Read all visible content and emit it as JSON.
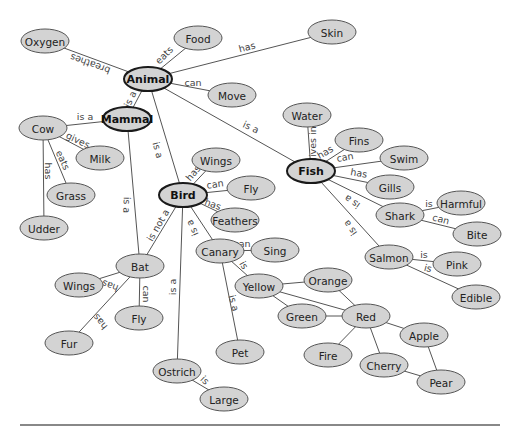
{
  "diagram": {
    "type": "semantic-network",
    "colors": {
      "node_fill": "#d3d3d3",
      "node_border": "#555555",
      "main_border": "#1a1a1a",
      "edge": "#555555",
      "rule": "#888888"
    },
    "nodes": [
      {
        "id": "oxygen",
        "label": "Oxygen",
        "x": 45,
        "y": 41,
        "rx": 24,
        "ry": 12,
        "main": false
      },
      {
        "id": "food",
        "label": "Food",
        "x": 198,
        "y": 38,
        "rx": 24,
        "ry": 12,
        "main": false
      },
      {
        "id": "skin",
        "label": "Skin",
        "x": 332,
        "y": 32,
        "rx": 24,
        "ry": 12,
        "main": false
      },
      {
        "id": "animal",
        "label": "Animal",
        "x": 148,
        "y": 79,
        "rx": 24,
        "ry": 12,
        "main": true
      },
      {
        "id": "move",
        "label": "Move",
        "x": 232,
        "y": 95,
        "rx": 24,
        "ry": 12,
        "main": false
      },
      {
        "id": "mammal",
        "label": "Mammal",
        "x": 127,
        "y": 119,
        "rx": 24,
        "ry": 12,
        "main": true
      },
      {
        "id": "cow",
        "label": "Cow",
        "x": 43,
        "y": 128,
        "rx": 24,
        "ry": 12,
        "main": false
      },
      {
        "id": "milk",
        "label": "Milk",
        "x": 100,
        "y": 158,
        "rx": 24,
        "ry": 12,
        "main": false
      },
      {
        "id": "grass",
        "label": "Grass",
        "x": 71,
        "y": 195,
        "rx": 24,
        "ry": 12,
        "main": false
      },
      {
        "id": "udder",
        "label": "Udder",
        "x": 44,
        "y": 228,
        "rx": 24,
        "ry": 12,
        "main": false
      },
      {
        "id": "water",
        "label": "Water",
        "x": 307,
        "y": 115,
        "rx": 24,
        "ry": 12,
        "main": false
      },
      {
        "id": "fins",
        "label": "Fins",
        "x": 359,
        "y": 140,
        "rx": 24,
        "ry": 12,
        "main": false
      },
      {
        "id": "swim",
        "label": "Swim",
        "x": 404,
        "y": 158,
        "rx": 24,
        "ry": 12,
        "main": false
      },
      {
        "id": "fish",
        "label": "Fish",
        "x": 311,
        "y": 171,
        "rx": 24,
        "ry": 12,
        "main": true
      },
      {
        "id": "gills",
        "label": "Gills",
        "x": 390,
        "y": 187,
        "rx": 24,
        "ry": 12,
        "main": false
      },
      {
        "id": "harmful",
        "label": "Harmful",
        "x": 461,
        "y": 203,
        "rx": 24,
        "ry": 12,
        "main": false
      },
      {
        "id": "shark",
        "label": "Shark",
        "x": 400,
        "y": 215,
        "rx": 24,
        "ry": 12,
        "main": false
      },
      {
        "id": "bite",
        "label": "Bite",
        "x": 477,
        "y": 234,
        "rx": 24,
        "ry": 12,
        "main": false
      },
      {
        "id": "salmon",
        "label": "Salmon",
        "x": 389,
        "y": 257,
        "rx": 24,
        "ry": 12,
        "main": false
      },
      {
        "id": "pink",
        "label": "Pink",
        "x": 457,
        "y": 264,
        "rx": 24,
        "ry": 12,
        "main": false
      },
      {
        "id": "edible",
        "label": "Edible",
        "x": 476,
        "y": 297,
        "rx": 24,
        "ry": 12,
        "main": false
      },
      {
        "id": "wings_bird",
        "label": "Wings",
        "x": 216,
        "y": 160,
        "rx": 24,
        "ry": 12,
        "main": false
      },
      {
        "id": "fly_bird",
        "label": "Fly",
        "x": 251,
        "y": 188,
        "rx": 24,
        "ry": 12,
        "main": false
      },
      {
        "id": "bird",
        "label": "Bird",
        "x": 183,
        "y": 195,
        "rx": 24,
        "ry": 12,
        "main": true
      },
      {
        "id": "feathers",
        "label": "Feathers",
        "x": 235,
        "y": 220,
        "rx": 24,
        "ry": 12,
        "main": false
      },
      {
        "id": "canary",
        "label": "Canary",
        "x": 220,
        "y": 251,
        "rx": 24,
        "ry": 12,
        "main": false
      },
      {
        "id": "sing",
        "label": "Sing",
        "x": 275,
        "y": 250,
        "rx": 24,
        "ry": 12,
        "main": false
      },
      {
        "id": "orange",
        "label": "Orange",
        "x": 328,
        "y": 280,
        "rx": 24,
        "ry": 12,
        "main": false
      },
      {
        "id": "yellow",
        "label": "Yellow",
        "x": 259,
        "y": 286,
        "rx": 24,
        "ry": 12,
        "main": false
      },
      {
        "id": "green",
        "label": "Green",
        "x": 302,
        "y": 316,
        "rx": 24,
        "ry": 12,
        "main": false
      },
      {
        "id": "red",
        "label": "Red",
        "x": 366,
        "y": 316,
        "rx": 24,
        "ry": 12,
        "main": false
      },
      {
        "id": "apple",
        "label": "Apple",
        "x": 424,
        "y": 335,
        "rx": 24,
        "ry": 12,
        "main": false
      },
      {
        "id": "fire",
        "label": "Fire",
        "x": 328,
        "y": 355,
        "rx": 24,
        "ry": 12,
        "main": false
      },
      {
        "id": "cherry",
        "label": "Cherry",
        "x": 384,
        "y": 365,
        "rx": 24,
        "ry": 12,
        "main": false
      },
      {
        "id": "pear",
        "label": "Pear",
        "x": 441,
        "y": 382,
        "rx": 24,
        "ry": 12,
        "main": false
      },
      {
        "id": "bat",
        "label": "Bat",
        "x": 140,
        "y": 266,
        "rx": 24,
        "ry": 12,
        "main": false
      },
      {
        "id": "wings_bat",
        "label": "Wings",
        "x": 79,
        "y": 285,
        "rx": 24,
        "ry": 12,
        "main": false
      },
      {
        "id": "fly_bat",
        "label": "Fly",
        "x": 139,
        "y": 318,
        "rx": 24,
        "ry": 12,
        "main": false
      },
      {
        "id": "fur",
        "label": "Fur",
        "x": 69,
        "y": 343,
        "rx": 24,
        "ry": 12,
        "main": false
      },
      {
        "id": "pet",
        "label": "Pet",
        "x": 240,
        "y": 352,
        "rx": 24,
        "ry": 12,
        "main": false
      },
      {
        "id": "ostrich",
        "label": "Ostrich",
        "x": 177,
        "y": 371,
        "rx": 24,
        "ry": 12,
        "main": false
      },
      {
        "id": "large",
        "label": "Large",
        "x": 224,
        "y": 399,
        "rx": 24,
        "ry": 12,
        "main": false
      }
    ],
    "edges": [
      {
        "from": "animal",
        "to": "oxygen",
        "label": "breathes",
        "lx": 90,
        "ly": 64,
        "rot": 200
      },
      {
        "from": "animal",
        "to": "food",
        "label": "eats",
        "lx": 164,
        "ly": 55,
        "rot": -45
      },
      {
        "from": "animal",
        "to": "skin",
        "label": "has",
        "lx": 247,
        "ly": 47,
        "rot": -15
      },
      {
        "from": "animal",
        "to": "move",
        "label": "can",
        "lx": 193,
        "ly": 82,
        "rot": 0
      },
      {
        "from": "animal",
        "to": "mammal",
        "label": "is a",
        "lx": 130,
        "ly": 99,
        "rot": -65
      },
      {
        "from": "animal",
        "to": "bird",
        "label": "is a",
        "lx": 158,
        "ly": 150,
        "rot": 75
      },
      {
        "from": "animal",
        "to": "fish",
        "label": "is a",
        "lx": 251,
        "ly": 127,
        "rot": 25
      },
      {
        "from": "mammal",
        "to": "cow",
        "label": "is a",
        "lx": 85,
        "ly": 116,
        "rot": 0
      },
      {
        "from": "mammal",
        "to": "bat",
        "label": "is a",
        "lx": 127,
        "ly": 205,
        "rot": 92
      },
      {
        "from": "cow",
        "to": "milk",
        "label": "gives",
        "lx": 78,
        "ly": 140,
        "rot": 25
      },
      {
        "from": "cow",
        "to": "grass",
        "label": "eats",
        "lx": 63,
        "ly": 160,
        "rot": 65
      },
      {
        "from": "cow",
        "to": "udder",
        "label": "has",
        "lx": 48,
        "ly": 171,
        "rot": 90
      },
      {
        "from": "fish",
        "to": "water",
        "label": "lives in",
        "lx": 312,
        "ly": 143,
        "rot": -90
      },
      {
        "from": "fish",
        "to": "fins",
        "label": "has",
        "lx": 325,
        "ly": 152,
        "rot": -30
      },
      {
        "from": "fish",
        "to": "swim",
        "label": "can",
        "lx": 345,
        "ly": 157,
        "rot": -10
      },
      {
        "from": "fish",
        "to": "gills",
        "label": "has",
        "lx": 359,
        "ly": 173,
        "rot": 10
      },
      {
        "from": "fish",
        "to": "shark",
        "label": "is a",
        "lx": 352,
        "ly": 202,
        "rot": 215
      },
      {
        "from": "fish",
        "to": "salmon",
        "label": "is a",
        "lx": 350,
        "ly": 228,
        "rot": 235
      },
      {
        "from": "shark",
        "to": "harmful",
        "label": "is",
        "lx": 429,
        "ly": 203,
        "rot": 0
      },
      {
        "from": "shark",
        "to": "bite",
        "label": "can",
        "lx": 441,
        "ly": 219,
        "rot": 15
      },
      {
        "from": "salmon",
        "to": "pink",
        "label": "is",
        "lx": 424,
        "ly": 254,
        "rot": 0
      },
      {
        "from": "salmon",
        "to": "edible",
        "label": "is",
        "lx": 428,
        "ly": 268,
        "rot": 15
      },
      {
        "from": "bird",
        "to": "wings_bird",
        "label": "has",
        "lx": 193,
        "ly": 173,
        "rot": -50
      },
      {
        "from": "bird",
        "to": "fly_bird",
        "label": "can",
        "lx": 215,
        "ly": 184,
        "rot": -8
      },
      {
        "from": "bird",
        "to": "feathers",
        "label": "has",
        "lx": 213,
        "ly": 204,
        "rot": 20
      },
      {
        "from": "bird",
        "to": "canary",
        "label": "is a",
        "lx": 192,
        "ly": 228,
        "rot": 245
      },
      {
        "from": "bird",
        "to": "bat",
        "label": "is not a",
        "lx": 158,
        "ly": 225,
        "rot": -60
      },
      {
        "from": "bird",
        "to": "ostrich",
        "label": "is a",
        "lx": 172,
        "ly": 287,
        "rot": -90
      },
      {
        "from": "canary",
        "to": "sing",
        "label": "can",
        "lx": 242,
        "ly": 243,
        "rot": 0
      },
      {
        "from": "canary",
        "to": "yellow",
        "label": "is",
        "lx": 244,
        "ly": 265,
        "rot": 60
      },
      {
        "from": "canary",
        "to": "pet",
        "label": "is a",
        "lx": 234,
        "ly": 303,
        "rot": 75
      },
      {
        "from": "yellow",
        "to": "orange",
        "label": "",
        "lx": 0,
        "ly": 0,
        "rot": 0
      },
      {
        "from": "yellow",
        "to": "green",
        "label": "",
        "lx": 0,
        "ly": 0,
        "rot": 0
      },
      {
        "from": "yellow",
        "to": "red",
        "label": "",
        "lx": 0,
        "ly": 0,
        "rot": 0
      },
      {
        "from": "orange",
        "to": "red",
        "label": "",
        "lx": 0,
        "ly": 0,
        "rot": 0
      },
      {
        "from": "green",
        "to": "red",
        "label": "",
        "lx": 0,
        "ly": 0,
        "rot": 0
      },
      {
        "from": "red",
        "to": "apple",
        "label": "",
        "lx": 0,
        "ly": 0,
        "rot": 0
      },
      {
        "from": "red",
        "to": "fire",
        "label": "",
        "lx": 0,
        "ly": 0,
        "rot": 0
      },
      {
        "from": "red",
        "to": "cherry",
        "label": "",
        "lx": 0,
        "ly": 0,
        "rot": 0
      },
      {
        "from": "apple",
        "to": "pear",
        "label": "",
        "lx": 0,
        "ly": 0,
        "rot": 0
      },
      {
        "from": "cherry",
        "to": "pear",
        "label": "",
        "lx": 0,
        "ly": 0,
        "rot": 0
      },
      {
        "from": "bat",
        "to": "wings_bat",
        "label": "has",
        "lx": 110,
        "ly": 286,
        "rot": 200
      },
      {
        "from": "bat",
        "to": "fly_bat",
        "label": "can",
        "lx": 146,
        "ly": 294,
        "rot": 90
      },
      {
        "from": "bat",
        "to": "fur",
        "label": "has",
        "lx": 100,
        "ly": 322,
        "rot": 230
      },
      {
        "from": "ostrich",
        "to": "large",
        "label": "is",
        "lx": 205,
        "ly": 380,
        "rot": 45
      }
    ]
  }
}
